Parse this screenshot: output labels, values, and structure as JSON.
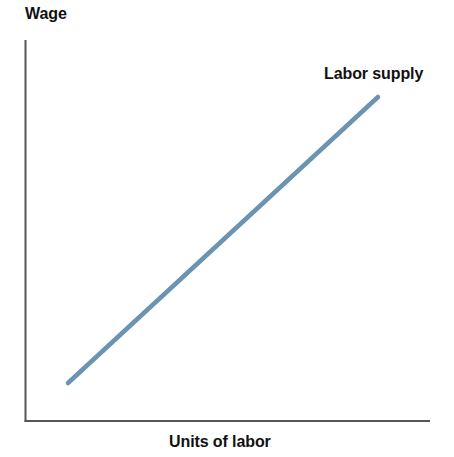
{
  "figure": {
    "width": 454,
    "height": 457,
    "background": "#ffffff"
  },
  "chart_data": {
    "type": "line",
    "title": "",
    "subtitle": "",
    "xlabel": "Units of labor",
    "ylabel": "Wage",
    "grid": false,
    "legend_position": "inline-end-of-line",
    "axis_color": "#555555",
    "axis_ticks": {
      "x": [],
      "y": []
    },
    "xlim": [
      0,
      1
    ],
    "ylim": [
      0,
      1
    ],
    "series": [
      {
        "name": "Labor supply",
        "color": "#6b93b2",
        "line_width": 4.5,
        "x": [
          0.107,
          1.0
        ],
        "y": [
          0.1,
          0.85
        ],
        "points_px": [
          {
            "x": 68,
            "y": 383
          },
          {
            "x": 378,
            "y": 97
          }
        ],
        "annotation": "Labor supply"
      }
    ],
    "axes_px": {
      "origin": {
        "x": 25.5,
        "y": 421
      },
      "y_axis_top": {
        "x": 25.5,
        "y": 40
      },
      "x_axis_right": {
        "x": 430,
        "y": 421
      }
    }
  },
  "labels": {
    "y_axis": "Wage",
    "x_axis": "Units of labor",
    "supply_curve": "Labor supply"
  },
  "colors": {
    "supply_line": "#6b93b2",
    "axis": "#555555",
    "text": "#111111",
    "background": "#ffffff"
  }
}
